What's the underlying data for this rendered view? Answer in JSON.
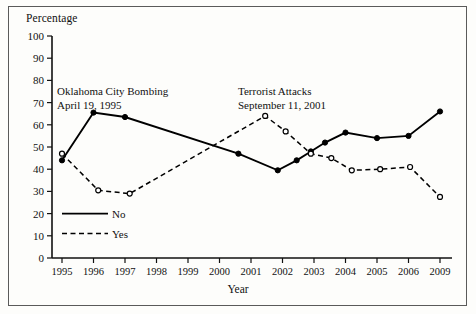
{
  "chart_data": {
    "type": "line",
    "title": "",
    "xlabel": "Year",
    "ylabel": "Percentage",
    "ylim": [
      0,
      100
    ],
    "ytick_step": 10,
    "yticks": [
      0,
      10,
      20,
      30,
      40,
      50,
      60,
      70,
      80,
      90,
      100
    ],
    "categories": [
      "1995",
      "1996",
      "1997",
      "1998",
      "1999",
      "2000",
      "2001",
      "2002",
      "2003",
      "2004",
      "2005",
      "2006",
      "2009"
    ],
    "grid": false,
    "legend_position": "inside-lower-left",
    "series": [
      {
        "name": "No",
        "style": "solid",
        "marker": "filled-circle",
        "color": "#000000",
        "points": [
          {
            "x": 0.0,
            "label": "1995",
            "y": 44
          },
          {
            "x": 1.0,
            "label": "1996",
            "y": 65.5
          },
          {
            "x": 2.0,
            "label": "1997",
            "y": 63.5
          },
          {
            "x": 5.6,
            "label": "2000-2001",
            "y": 47
          },
          {
            "x": 6.85,
            "label": "2001",
            "y": 39.5
          },
          {
            "x": 7.45,
            "label": "2002",
            "y": 44
          },
          {
            "x": 7.9,
            "label": "2002",
            "y": 48
          },
          {
            "x": 8.35,
            "label": "2003",
            "y": 52
          },
          {
            "x": 9.0,
            "label": "2004",
            "y": 56.5
          },
          {
            "x": 10.0,
            "label": "2005",
            "y": 54
          },
          {
            "x": 11.0,
            "label": "2006",
            "y": 55
          },
          {
            "x": 12.0,
            "label": "2009",
            "y": 66
          }
        ]
      },
      {
        "name": "Yes",
        "style": "dashed",
        "marker": "open-circle",
        "color": "#000000",
        "points": [
          {
            "x": 0.0,
            "label": "1995",
            "y": 47
          },
          {
            "x": 1.15,
            "label": "1996",
            "y": 30.5
          },
          {
            "x": 2.15,
            "label": "1997",
            "y": 29
          },
          {
            "x": 6.45,
            "label": "2001",
            "y": 64
          },
          {
            "x": 7.1,
            "label": "2001-2002",
            "y": 57
          },
          {
            "x": 7.9,
            "label": "2002",
            "y": 47
          },
          {
            "x": 8.55,
            "label": "2003",
            "y": 45
          },
          {
            "x": 9.2,
            "label": "2004",
            "y": 39.5
          },
          {
            "x": 10.1,
            "label": "2005",
            "y": 40
          },
          {
            "x": 11.05,
            "label": "2006",
            "y": 41
          },
          {
            "x": 12.0,
            "label": "2009",
            "y": 27.5
          }
        ]
      }
    ],
    "annotations": [
      {
        "id": "oklahoma",
        "lines": [
          "Oklahoma City Bombing",
          "April 19, 1995"
        ],
        "x_px": 57,
        "y_px": 85
      },
      {
        "id": "terrorist",
        "lines": [
          "Terrorist Attacks",
          "September 11, 2001"
        ],
        "x_px": 238,
        "y_px": 85
      }
    ],
    "legend": [
      {
        "name": "No",
        "style": "solid"
      },
      {
        "name": "Yes",
        "style": "dashed"
      }
    ]
  },
  "axes": {
    "y_title": "Percentage",
    "x_title": "Year"
  }
}
